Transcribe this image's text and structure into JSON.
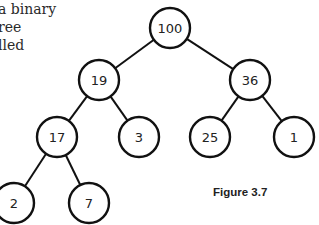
{
  "text_fragment": {
    "lines": [
      "a binary",
      "ree",
      "lled"
    ]
  },
  "figure": {
    "caption": "Figure 3.7",
    "type": "binary-tree",
    "node_radius": 20,
    "stroke_color": "#111111",
    "nodes": [
      {
        "id": "n100",
        "value": "100",
        "x": 170,
        "y": 28
      },
      {
        "id": "n19",
        "value": "19",
        "x": 99,
        "y": 80
      },
      {
        "id": "n36",
        "value": "36",
        "x": 250,
        "y": 80
      },
      {
        "id": "n17",
        "value": "17",
        "x": 57,
        "y": 137
      },
      {
        "id": "n3",
        "value": "3",
        "x": 139,
        "y": 137
      },
      {
        "id": "n25",
        "value": "25",
        "x": 210,
        "y": 137
      },
      {
        "id": "n1",
        "value": "1",
        "x": 294,
        "y": 137
      },
      {
        "id": "n2",
        "value": "2",
        "x": 14,
        "y": 203
      },
      {
        "id": "n7",
        "value": "7",
        "x": 89,
        "y": 203
      }
    ],
    "edges": [
      [
        "n100",
        "n19"
      ],
      [
        "n100",
        "n36"
      ],
      [
        "n19",
        "n17"
      ],
      [
        "n19",
        "n3"
      ],
      [
        "n36",
        "n25"
      ],
      [
        "n36",
        "n1"
      ],
      [
        "n17",
        "n2"
      ],
      [
        "n17",
        "n7"
      ]
    ]
  }
}
